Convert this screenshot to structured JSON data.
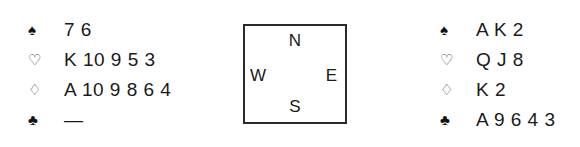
{
  "diagram": {
    "type": "bridge-hand-diagram",
    "background_color": "#ffffff",
    "ink_color": "#1a1a1a"
  },
  "suit_symbols": {
    "spade": "♠",
    "heart": "♡",
    "diamond": "♢",
    "club": "♣"
  },
  "compass": {
    "north": "N",
    "south": "S",
    "west": "W",
    "east": "E",
    "border_color": "#2b2b2b"
  },
  "hands": {
    "west": {
      "position_label": "West",
      "suits": [
        {
          "suit": "spade",
          "symbol": "♠",
          "cards": "7 6",
          "filled": true
        },
        {
          "suit": "heart",
          "symbol": "♡",
          "cards": "K 10 9 5 3",
          "filled": false
        },
        {
          "suit": "diamond",
          "symbol": "♢",
          "cards": "A 10 9 8 6 4",
          "filled": false
        },
        {
          "suit": "club",
          "symbol": "♣",
          "cards": "—",
          "filled": true
        }
      ]
    },
    "east": {
      "position_label": "East",
      "suits": [
        {
          "suit": "spade",
          "symbol": "♠",
          "cards": "A K 2",
          "filled": true
        },
        {
          "suit": "heart",
          "symbol": "♡",
          "cards": "Q J 8",
          "filled": false
        },
        {
          "suit": "diamond",
          "symbol": "♢",
          "cards": "K 2",
          "filled": false
        },
        {
          "suit": "club",
          "symbol": "♣",
          "cards": "A 9 6 4 3",
          "filled": true
        }
      ]
    }
  }
}
